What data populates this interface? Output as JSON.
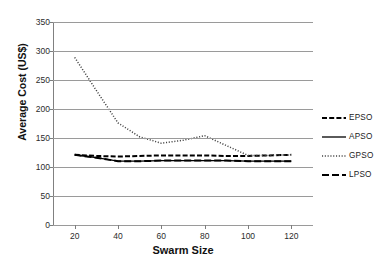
{
  "chart_data": {
    "type": "line",
    "title": "",
    "xlabel": "Swarm Size",
    "ylabel": "Average Cost (US$)",
    "xlim": [
      10,
      130
    ],
    "ylim": [
      0,
      350
    ],
    "xticks": [
      20,
      40,
      60,
      80,
      100,
      120
    ],
    "yticks": [
      0,
      50,
      100,
      150,
      200,
      250,
      300,
      350
    ],
    "grid": "horizontal",
    "legend_position": "right",
    "x": [
      20,
      30,
      40,
      50,
      60,
      70,
      80,
      90,
      100,
      110,
      120
    ],
    "series": [
      {
        "name": "EPSO",
        "style": "dashed",
        "color": "#000000",
        "values": [
          121,
          119,
          118,
          119,
          120,
          120,
          120,
          119,
          119,
          120,
          121
        ]
      },
      {
        "name": "APSO",
        "style": "solid",
        "color": "#000000",
        "values": [
          121,
          116,
          110,
          110,
          111,
          111,
          111,
          111,
          110,
          110,
          110
        ]
      },
      {
        "name": "GPSO",
        "style": "dotted",
        "color": "#444444",
        "values": [
          289,
          232,
          176,
          152,
          141,
          146,
          154,
          137,
          120,
          120,
          121
        ]
      },
      {
        "name": "LPSO",
        "style": "longdash",
        "color": "#000000",
        "values": [
          121,
          116,
          110,
          110,
          111,
          111,
          111,
          111,
          110,
          110,
          110
        ]
      }
    ]
  },
  "axes": {
    "y_tick_labels": [
      "350",
      "300",
      "250",
      "200",
      "150",
      "100",
      "50",
      "0"
    ],
    "x_tick_labels": [
      "20",
      "40",
      "60",
      "80",
      "100",
      "120"
    ],
    "y_title": "Average Cost (US$)",
    "x_title": "Swarm Size"
  },
  "legend": {
    "items": [
      {
        "label": "EPSO",
        "style": "dashed"
      },
      {
        "label": "APSO",
        "style": "solid"
      },
      {
        "label": "GPSO",
        "style": "dotted"
      },
      {
        "label": "LPSO",
        "style": "longdash"
      }
    ]
  }
}
